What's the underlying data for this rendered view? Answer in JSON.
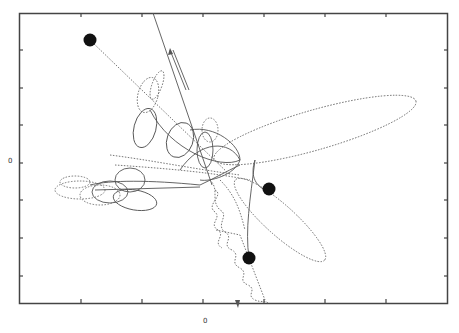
{
  "figure": {
    "type": "trajectory-plot",
    "axes": {
      "x_zero_label": "0",
      "y_zero_label": "0",
      "x_ticks": 6,
      "y_ticks": 6
    },
    "colors": {
      "frame": "#444444",
      "trajectory": "#555555",
      "marker": "#111111",
      "background": "#ffffff"
    },
    "markers": [
      {
        "name": "start-upper-left",
        "x": 90,
        "y": 40
      },
      {
        "name": "mid-right",
        "x": 269,
        "y": 189
      },
      {
        "name": "lower-center",
        "x": 249,
        "y": 258
      }
    ]
  }
}
